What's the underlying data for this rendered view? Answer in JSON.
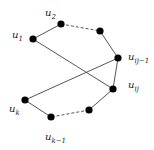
{
  "diagram": {
    "title": "",
    "nodes": [
      {
        "id": "u1",
        "x": 33,
        "y": 39,
        "label_base": "u",
        "label_sub": "1",
        "lx": 12,
        "ly": 30
      },
      {
        "id": "u2",
        "x": 61,
        "y": 24,
        "label_base": "u",
        "label_sub": "2",
        "lx": 45,
        "ly": 8
      },
      {
        "id": "n3",
        "x": 100,
        "y": 31,
        "label_base": "",
        "label_sub": "",
        "lx": 0,
        "ly": 0
      },
      {
        "id": "uij_minus_1",
        "x": 118,
        "y": 58,
        "label_base": "u",
        "label_sub": "ij−1",
        "lx": 128,
        "ly": 52
      },
      {
        "id": "uij",
        "x": 113,
        "y": 89,
        "label_base": "u",
        "label_sub": "ij",
        "lx": 128,
        "ly": 80
      },
      {
        "id": "n6",
        "x": 89,
        "y": 110,
        "label_base": "",
        "label_sub": "",
        "lx": 0,
        "ly": 0
      },
      {
        "id": "uk_minus_1",
        "x": 51,
        "y": 117,
        "label_base": "u",
        "label_sub": "k−1",
        "lx": 45,
        "ly": 132
      },
      {
        "id": "uk",
        "x": 25,
        "y": 100,
        "label_base": "u",
        "label_sub": "k",
        "lx": 9,
        "ly": 104
      }
    ],
    "edges": [
      {
        "from": "u1",
        "to": "u2",
        "style": "solid"
      },
      {
        "from": "u2",
        "to": "n3",
        "style": "dashed"
      },
      {
        "from": "n3",
        "to": "uij_minus_1",
        "style": "solid"
      },
      {
        "from": "uij_minus_1",
        "to": "uk",
        "style": "solid"
      },
      {
        "from": "u1",
        "to": "uij",
        "style": "solid"
      },
      {
        "from": "uij_minus_1",
        "to": "uij",
        "style": "solid"
      },
      {
        "from": "uij",
        "to": "n6",
        "style": "solid"
      },
      {
        "from": "n6",
        "to": "uk_minus_1",
        "style": "dashed"
      },
      {
        "from": "uk_minus_1",
        "to": "uk",
        "style": "solid"
      }
    ],
    "colors": {
      "node": "#000000",
      "edge": "#555555"
    }
  }
}
